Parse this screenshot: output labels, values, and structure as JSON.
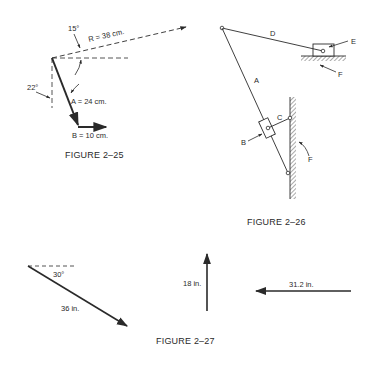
{
  "figures": {
    "fig25": {
      "caption": "FIGURE 2–25",
      "angle_top": "15°",
      "angle_left": "22°",
      "vector_R": "R = 38 cm.",
      "vector_A": "A = 24 cm.",
      "vector_B": "B = 10 cm."
    },
    "fig26": {
      "caption": "FIGURE 2–26",
      "label_A": "A",
      "label_B": "B",
      "label_C": "C",
      "label_D": "D",
      "label_E": "E",
      "label_F_ground": "F",
      "label_F_wall": "F"
    },
    "fig27": {
      "caption": "FIGURE 2–27",
      "angle": "30°",
      "vector_1": "36 in.",
      "vector_2": "18 in.",
      "vector_3": "31.2 in."
    }
  },
  "colors": {
    "ink": "#2a2a2a",
    "background": "#ffffff"
  }
}
